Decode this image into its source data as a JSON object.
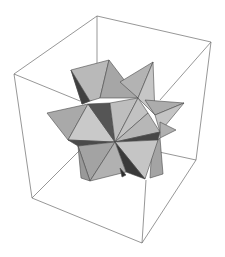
{
  "figure": {
    "type": "3d-polyhedron-render",
    "background": "#ffffff",
    "colors": {
      "box_edge": "#6a6a6a",
      "face_light": "#c8c8c8",
      "face_mid": "#b0b0b0",
      "face_shade": "#9a9a9a",
      "face_dark": "#555555",
      "face_darkest": "#3a3a3a",
      "face_edge": "#4a4a4a"
    },
    "bounding_box": {
      "front_edges": [
        [
          14,
          74,
          97,
          16
        ],
        [
          97,
          16,
          211,
          42
        ],
        [
          14,
          74,
          32,
          198
        ],
        [
          32,
          198,
          142,
          243
        ],
        [
          142,
          243,
          196,
          160
        ],
        [
          196,
          160,
          211,
          42
        ]
      ],
      "hidden_edges": [
        [
          14,
          74,
          146,
          111
        ],
        [
          211,
          42,
          146,
          111
        ],
        [
          32,
          198,
          80,
          147
        ],
        [
          146,
          178,
          142,
          243
        ],
        [
          97,
          16,
          97,
          70
        ],
        [
          146,
          180,
          196,
          160
        ]
      ]
    }
  }
}
